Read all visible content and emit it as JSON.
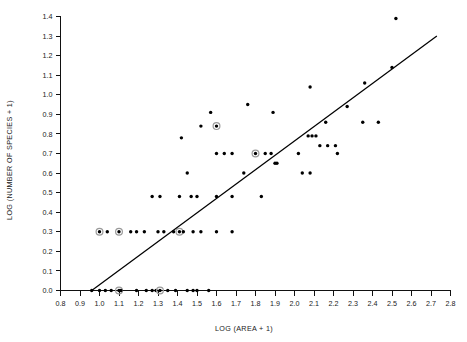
{
  "chart_data": {
    "type": "scatter",
    "title": "",
    "xlabel": "LOG (AREA + 1)",
    "ylabel": "LOG (NUMBER OF SPECIES + 1)",
    "xlim": [
      0.8,
      2.8
    ],
    "ylim": [
      0.0,
      1.4
    ],
    "xticks": [
      "0.8",
      "0.9",
      "1.0",
      "1.1",
      "1.2",
      "1.3",
      "1.4",
      "1.5",
      "1.6",
      "1.7",
      "1.8",
      "1.9",
      "2.0",
      "2.1",
      "2.2",
      "2.3",
      "2.4",
      "2.5",
      "2.6",
      "2.7",
      "2.8"
    ],
    "yticks": [
      "0.0",
      "0.1",
      "0.2",
      "0.3",
      "0.4",
      "0.5",
      "0.6",
      "0.7",
      "0.8",
      "0.9",
      "1.0",
      "1.1",
      "1.2",
      "1.3",
      "1.4"
    ],
    "grid": false,
    "legend": null,
    "marker_color": "#000000",
    "highlight_ring_color": "#9a9a9a",
    "trend_line": {
      "label": "regression line",
      "color": "#000000",
      "x_start": 0.96,
      "y_start": 0.0,
      "x_end": 2.73,
      "y_end": 1.3
    },
    "points": [
      {
        "x": 0.96,
        "y": 0.0
      },
      {
        "x": 1.0,
        "y": 0.0
      },
      {
        "x": 1.03,
        "y": 0.0
      },
      {
        "x": 1.06,
        "y": 0.0
      },
      {
        "x": 1.1,
        "y": 0.0,
        "highlight": true
      },
      {
        "x": 1.11,
        "y": 0.0
      },
      {
        "x": 1.19,
        "y": 0.0
      },
      {
        "x": 1.24,
        "y": 0.0
      },
      {
        "x": 1.27,
        "y": 0.0
      },
      {
        "x": 1.29,
        "y": 0.0
      },
      {
        "x": 1.31,
        "y": 0.0,
        "highlight": true
      },
      {
        "x": 1.35,
        "y": 0.0
      },
      {
        "x": 1.39,
        "y": 0.0
      },
      {
        "x": 1.45,
        "y": 0.0
      },
      {
        "x": 1.48,
        "y": 0.0
      },
      {
        "x": 1.5,
        "y": 0.0
      },
      {
        "x": 1.56,
        "y": 0.0
      },
      {
        "x": 1.0,
        "y": 0.3,
        "highlight": true
      },
      {
        "x": 1.04,
        "y": 0.3
      },
      {
        "x": 1.1,
        "y": 0.3,
        "highlight": true
      },
      {
        "x": 1.16,
        "y": 0.3
      },
      {
        "x": 1.19,
        "y": 0.3
      },
      {
        "x": 1.23,
        "y": 0.3
      },
      {
        "x": 1.3,
        "y": 0.3
      },
      {
        "x": 1.33,
        "y": 0.3
      },
      {
        "x": 1.38,
        "y": 0.3
      },
      {
        "x": 1.41,
        "y": 0.3,
        "highlight": true
      },
      {
        "x": 1.43,
        "y": 0.3
      },
      {
        "x": 1.48,
        "y": 0.3
      },
      {
        "x": 1.52,
        "y": 0.3
      },
      {
        "x": 1.6,
        "y": 0.3
      },
      {
        "x": 1.68,
        "y": 0.3
      },
      {
        "x": 1.27,
        "y": 0.48
      },
      {
        "x": 1.31,
        "y": 0.48
      },
      {
        "x": 1.41,
        "y": 0.48
      },
      {
        "x": 1.47,
        "y": 0.48
      },
      {
        "x": 1.5,
        "y": 0.48
      },
      {
        "x": 1.6,
        "y": 0.48
      },
      {
        "x": 1.68,
        "y": 0.48
      },
      {
        "x": 1.83,
        "y": 0.48
      },
      {
        "x": 1.45,
        "y": 0.6
      },
      {
        "x": 1.74,
        "y": 0.6
      },
      {
        "x": 2.04,
        "y": 0.6
      },
      {
        "x": 2.08,
        "y": 0.6
      },
      {
        "x": 1.9,
        "y": 0.65
      },
      {
        "x": 1.91,
        "y": 0.65
      },
      {
        "x": 1.6,
        "y": 0.7
      },
      {
        "x": 1.64,
        "y": 0.7
      },
      {
        "x": 1.68,
        "y": 0.7
      },
      {
        "x": 1.8,
        "y": 0.7,
        "highlight": true
      },
      {
        "x": 1.85,
        "y": 0.7
      },
      {
        "x": 1.88,
        "y": 0.7
      },
      {
        "x": 2.02,
        "y": 0.7
      },
      {
        "x": 2.22,
        "y": 0.7
      },
      {
        "x": 2.13,
        "y": 0.74
      },
      {
        "x": 2.17,
        "y": 0.74
      },
      {
        "x": 2.21,
        "y": 0.74
      },
      {
        "x": 1.42,
        "y": 0.78
      },
      {
        "x": 2.07,
        "y": 0.79
      },
      {
        "x": 2.09,
        "y": 0.79
      },
      {
        "x": 2.11,
        "y": 0.79
      },
      {
        "x": 1.52,
        "y": 0.84
      },
      {
        "x": 1.6,
        "y": 0.84,
        "highlight": true
      },
      {
        "x": 2.16,
        "y": 0.86
      },
      {
        "x": 2.35,
        "y": 0.86
      },
      {
        "x": 2.43,
        "y": 0.86
      },
      {
        "x": 1.57,
        "y": 0.91
      },
      {
        "x": 1.89,
        "y": 0.91
      },
      {
        "x": 2.27,
        "y": 0.94
      },
      {
        "x": 1.76,
        "y": 0.95
      },
      {
        "x": 2.08,
        "y": 1.04
      },
      {
        "x": 2.36,
        "y": 1.06
      },
      {
        "x": 2.5,
        "y": 1.14
      },
      {
        "x": 2.52,
        "y": 1.39
      }
    ]
  }
}
